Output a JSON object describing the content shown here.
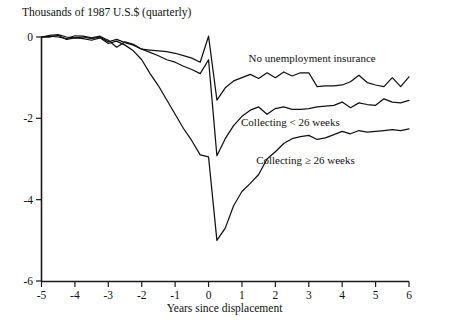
{
  "chart_data": {
    "type": "line",
    "title": "Thousands of 1987 U.S.$ (quarterly)",
    "subtitle": "",
    "xlabel": "Years since displacement",
    "ylabel": "",
    "xlim": [
      -5,
      6
    ],
    "ylim": [
      -6,
      0
    ],
    "xticks": [
      -5,
      -4,
      -3,
      -2,
      -1,
      0,
      1,
      2,
      3,
      4,
      5,
      6
    ],
    "xtick_labels": [
      "-5",
      "-4",
      "-3",
      "-2",
      "-1",
      "0",
      "1",
      "2",
      "3",
      "4",
      "5",
      "6"
    ],
    "yticks": [
      0,
      -2,
      -4,
      -6
    ],
    "ytick_labels": [
      "0",
      "-2",
      "-4",
      "-6"
    ],
    "grid": false,
    "legend_position": "inline-annotations",
    "annotations": [
      {
        "text": "No unemployment insurance",
        "x": 3.1,
        "y": -0.62
      },
      {
        "text": "Collecting < 26 weeks",
        "x": 2.45,
        "y": -2.2
      },
      {
        "text": "Collecting ≥ 26 weeks",
        "x": 2.9,
        "y": -3.12
      }
    ],
    "series": [
      {
        "name": "No unemployment insurance",
        "x": [
          -5.0,
          -4.75,
          -4.5,
          -4.25,
          -4.0,
          -3.75,
          -3.5,
          -3.25,
          -3.0,
          -2.75,
          -2.5,
          -2.25,
          -2.0,
          -1.75,
          -1.5,
          -1.25,
          -1.0,
          -0.75,
          -0.5,
          -0.25,
          0.0,
          0.25,
          0.5,
          0.75,
          1.0,
          1.25,
          1.5,
          1.75,
          2.0,
          2.25,
          2.5,
          2.75,
          3.0,
          3.25,
          3.5,
          3.75,
          4.0,
          4.25,
          4.5,
          4.75,
          5.0,
          5.25,
          5.5,
          5.75,
          6.0
        ],
        "y": [
          0.0,
          0.02,
          0.0,
          -0.04,
          0.03,
          0.02,
          -0.02,
          0.02,
          -0.08,
          -0.25,
          -0.12,
          -0.18,
          -0.3,
          -0.32,
          -0.34,
          -0.36,
          -0.4,
          -0.46,
          -0.52,
          -0.62,
          0.02,
          -1.55,
          -1.25,
          -1.08,
          -1.0,
          -0.92,
          -1.02,
          -0.88,
          -1.0,
          -0.86,
          -0.96,
          -0.88,
          -0.88,
          -1.22,
          -1.2,
          -1.2,
          -1.18,
          -1.1,
          -0.94,
          -1.12,
          -1.18,
          -1.22,
          -1.0,
          -1.22,
          -0.98
        ]
      },
      {
        "name": "Collecting < 26 weeks",
        "x": [
          -5.0,
          -4.75,
          -4.5,
          -4.25,
          -4.0,
          -3.75,
          -3.5,
          -3.25,
          -3.0,
          -2.75,
          -2.5,
          -2.25,
          -2.0,
          -1.75,
          -1.5,
          -1.25,
          -1.0,
          -0.75,
          -0.5,
          -0.25,
          0.0,
          0.25,
          0.5,
          0.75,
          1.0,
          1.25,
          1.5,
          1.75,
          2.0,
          2.25,
          2.5,
          2.75,
          3.0,
          3.25,
          3.5,
          3.75,
          4.0,
          4.25,
          4.5,
          4.75,
          5.0,
          5.25,
          5.5,
          5.75,
          6.0
        ],
        "y": [
          0.0,
          0.04,
          0.06,
          0.0,
          -0.02,
          0.0,
          -0.04,
          0.0,
          -0.12,
          -0.06,
          -0.14,
          -0.2,
          -0.3,
          -0.38,
          -0.46,
          -0.56,
          -0.62,
          -0.72,
          -0.8,
          -0.9,
          -0.56,
          -2.92,
          -2.5,
          -2.18,
          -1.95,
          -1.8,
          -1.72,
          -1.9,
          -1.76,
          -1.72,
          -1.78,
          -1.78,
          -1.76,
          -1.72,
          -1.7,
          -1.68,
          -1.6,
          -1.74,
          -1.62,
          -1.66,
          -1.68,
          -1.52,
          -1.6,
          -1.62,
          -1.56
        ]
      },
      {
        "name": "Collecting ≥ 26 weeks",
        "x": [
          -5.0,
          -4.75,
          -4.5,
          -4.25,
          -4.0,
          -3.75,
          -3.5,
          -3.25,
          -3.0,
          -2.75,
          -2.5,
          -2.25,
          -2.0,
          -1.75,
          -1.5,
          -1.25,
          -1.0,
          -0.75,
          -0.5,
          -0.25,
          0.0,
          0.25,
          0.5,
          0.75,
          1.0,
          1.25,
          1.5,
          1.75,
          2.0,
          2.25,
          2.5,
          2.75,
          3.0,
          3.25,
          3.5,
          3.75,
          4.0,
          4.25,
          4.5,
          4.75,
          5.0,
          5.25,
          5.5,
          5.75,
          6.0
        ],
        "y": [
          0.0,
          0.0,
          0.04,
          -0.06,
          -0.02,
          -0.04,
          -0.08,
          -0.02,
          -0.16,
          -0.1,
          -0.2,
          -0.34,
          -0.56,
          -0.9,
          -1.2,
          -1.55,
          -1.9,
          -2.25,
          -2.55,
          -2.9,
          -2.95,
          -5.0,
          -4.7,
          -4.15,
          -3.8,
          -3.6,
          -3.38,
          -3.0,
          -2.82,
          -2.62,
          -2.5,
          -2.45,
          -2.42,
          -2.52,
          -2.48,
          -2.4,
          -2.32,
          -2.38,
          -2.3,
          -2.34,
          -2.32,
          -2.3,
          -2.28,
          -2.3,
          -2.26
        ]
      }
    ]
  }
}
